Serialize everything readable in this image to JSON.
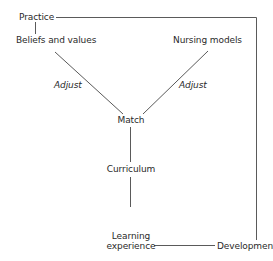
{
  "diagram": {
    "nodes": {
      "practice": "Practice",
      "beliefs": "Beliefs and values",
      "nursing_models": "Nursing models",
      "match": "Match",
      "curriculum": "Curriculum",
      "learning_line1": "Learning",
      "learning_line2": "experience",
      "development": "Development"
    },
    "edge_labels": {
      "adjust_left": "Adjust",
      "adjust_right": "Adjust"
    },
    "edges": [
      {
        "from": "Practice",
        "to": "Beliefs and values"
      },
      {
        "from": "Practice",
        "to": "Development"
      },
      {
        "from": "Beliefs and values",
        "to": "Match",
        "label": "Adjust"
      },
      {
        "from": "Nursing models",
        "to": "Match",
        "label": "Adjust"
      },
      {
        "from": "Match",
        "to": "Curriculum"
      },
      {
        "from": "Curriculum",
        "to": "Learning experience"
      },
      {
        "from": "Learning experience",
        "to": "Development"
      }
    ],
    "line_color": "#555555"
  }
}
